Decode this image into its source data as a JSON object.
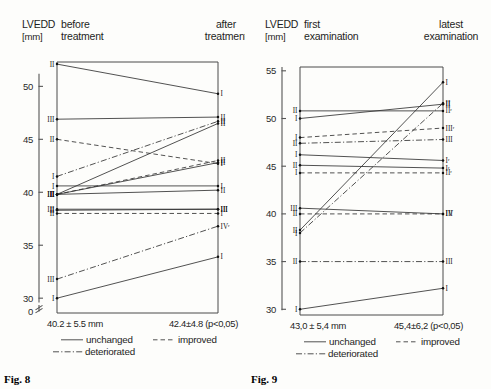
{
  "figures": [
    {
      "id": "fig8",
      "caption": "Fig. 8",
      "axis_title": "LVEDD",
      "axis_unit": "[mm]",
      "left_header_line1": "before",
      "left_header_line2": "treatment",
      "right_header_line1": "after",
      "right_header_line2": "treatment",
      "y_ticks": [
        50,
        45,
        40,
        35,
        30
      ],
      "y_axis_break_label": "0",
      "y_min": 28.6,
      "y_max": 52.3,
      "left_stat": "40.2 ± 5.5 mm",
      "right_stat": "42.4±4.8 (p<0,05)",
      "legend": [
        {
          "key": "unchanged",
          "label": "unchanged"
        },
        {
          "key": "improved",
          "label": "improved"
        },
        {
          "key": "deteriorated",
          "label": "deteriorated"
        }
      ],
      "chart_data": {
        "type": "line",
        "title": "LVEDD before vs after treatment",
        "xlabel": "",
        "ylabel": "LVEDD [mm]",
        "ylim": [
          28.6,
          52.3
        ],
        "categories": [
          "before treatment",
          "after treatment"
        ],
        "series": [
          {
            "name": "p01",
            "style": "unchanged",
            "left_label": "II",
            "right_label": "I",
            "values": [
              52.1,
              49.3
            ]
          },
          {
            "name": "p02",
            "style": "unchanged",
            "left_label": "III",
            "right_label": "II",
            "values": [
              46.9,
              47.1
            ]
          },
          {
            "name": "p03",
            "style": "improved",
            "left_label": "II",
            "right_label": "I",
            "values": [
              45.0,
              42.7
            ]
          },
          {
            "name": "p04",
            "style": "deteriorated",
            "left_label": "I",
            "right_label": "II",
            "values": [
              41.5,
              46.7
            ]
          },
          {
            "name": "p05",
            "style": "unchanged",
            "left_label": "I",
            "right_label": "I",
            "values": [
              40.6,
              40.6
            ]
          },
          {
            "name": "p06",
            "style": "unchanged",
            "left_label": "II",
            "right_label": "II",
            "values": [
              39.8,
              46.5
            ]
          },
          {
            "name": "p07",
            "style": "unchanged",
            "left_label": "III",
            "right_label": "II",
            "values": [
              39.8,
              42.8
            ]
          },
          {
            "name": "p08",
            "style": "improved",
            "left_label": "III",
            "right_label": "II",
            "values": [
              39.8,
              43.0
            ]
          },
          {
            "name": "p09",
            "style": "unchanged",
            "left_label": "II",
            "right_label": "II",
            "values": [
              39.8,
              40.2
            ]
          },
          {
            "name": "p10",
            "style": "unchanged",
            "left_label": "II",
            "right_label": "III",
            "values": [
              38.3,
              38.4
            ]
          },
          {
            "name": "p11",
            "style": "unchanged",
            "left_label": "III",
            "right_label": "III",
            "values": [
              38.4,
              38.4
            ]
          },
          {
            "name": "p12",
            "style": "improved",
            "left_label": "II",
            "right_label": "I",
            "values": [
              38.0,
              38.0
            ]
          },
          {
            "name": "p13",
            "style": "deteriorated",
            "left_label": "III",
            "right_label": "IVʳ",
            "values": [
              31.8,
              36.8
            ]
          },
          {
            "name": "p14",
            "style": "unchanged",
            "left_label": "I",
            "right_label": "I",
            "values": [
              30.0,
              33.9
            ]
          }
        ]
      }
    },
    {
      "id": "fig9",
      "caption": "Fig. 9",
      "axis_title": "LVEDD",
      "axis_unit": "[mm]",
      "left_header_line1": "first",
      "left_header_line2": "examination",
      "right_header_line1": "latest",
      "right_header_line2": "examination",
      "y_ticks": [
        55,
        50,
        45,
        40,
        35,
        30
      ],
      "y_min": 29.4,
      "y_max": 55.4,
      "left_stat": "43,0 ± 5,4 mm",
      "right_stat": "45,4±6,2 (p<0,05)",
      "legend": [
        {
          "key": "unchanged",
          "label": "unchanged"
        },
        {
          "key": "improved",
          "label": "improved"
        },
        {
          "key": "deteriorated",
          "label": "deteriorated"
        }
      ],
      "chart_data": {
        "type": "line",
        "title": "LVEDD first vs latest examination",
        "xlabel": "",
        "ylabel": "LVEDD [mm]",
        "ylim": [
          29.4,
          55.4
        ],
        "categories": [
          "first examination",
          "latest examination"
        ],
        "series": [
          {
            "name": "q01",
            "style": "unchanged",
            "left_label": "II",
            "right_label": "IIʳ",
            "values": [
              50.8,
              50.8
            ]
          },
          {
            "name": "q02",
            "style": "unchanged",
            "left_label": "I",
            "right_label": "II",
            "values": [
              50.0,
              51.5
            ]
          },
          {
            "name": "q03",
            "style": "improved",
            "left_label": "I",
            "right_label": "IIIʳ",
            "values": [
              48.0,
              49.0
            ]
          },
          {
            "name": "q04",
            "style": "deteriorated",
            "left_label": "II",
            "right_label": "III",
            "values": [
              47.4,
              47.8
            ]
          },
          {
            "name": "q05",
            "style": "unchanged",
            "left_label": "I",
            "right_label": "Iʳ",
            "values": [
              46.2,
              45.6
            ]
          },
          {
            "name": "q06",
            "style": "unchanged",
            "left_label": "II",
            "right_label": "Iʳ",
            "values": [
              45.1,
              44.8
            ]
          },
          {
            "name": "q07",
            "style": "improved",
            "left_label": "I",
            "right_label": "IIʳ",
            "values": [
              44.3,
              44.3
            ]
          },
          {
            "name": "q08",
            "style": "unchanged",
            "left_label": "III",
            "right_label": "III",
            "values": [
              40.6,
              40.0
            ]
          },
          {
            "name": "q09",
            "style": "improved",
            "left_label": "II",
            "right_label": "IV",
            "values": [
              40.0,
              40.0
            ]
          },
          {
            "name": "q10",
            "style": "unchanged",
            "left_label": "II",
            "right_label": "I",
            "values": [
              38.3,
              53.8
            ]
          },
          {
            "name": "q11",
            "style": "deteriorated",
            "left_label": "I",
            "right_label": "II",
            "values": [
              38.0,
              51.6
            ]
          },
          {
            "name": "q12",
            "style": "deteriorated",
            "left_label": "II",
            "right_label": "III",
            "values": [
              35.0,
              35.0
            ]
          },
          {
            "name": "q13",
            "style": "unchanged",
            "left_label": "I",
            "right_label": "I",
            "values": [
              30.0,
              32.2
            ]
          }
        ]
      }
    }
  ]
}
